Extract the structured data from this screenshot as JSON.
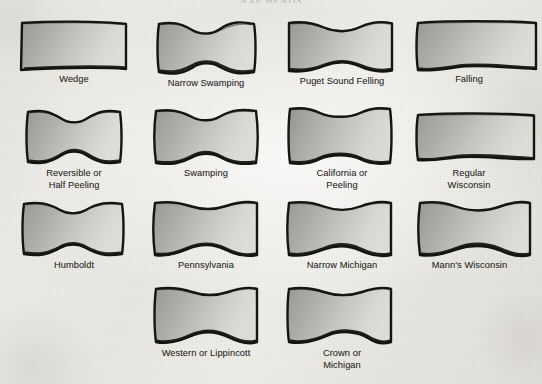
{
  "figure": {
    "kind": "axe-head-profile-chart",
    "running_head": "AXE HEADS",
    "background_color": "#e9e8e3",
    "ink_color": "#17150f",
    "blade_fill_light": "#d6d4d0",
    "blade_fill_dark": "#8f8d88",
    "caption_color": "#2c2a27",
    "columns": 4,
    "rows": 4,
    "item_count": 14
  },
  "items": [
    {
      "id": "wedge",
      "label": "Wedge",
      "row": 1,
      "column": 1,
      "shape": "wedge-straight-sided",
      "x": 18,
      "y": 20,
      "w": 112,
      "h": 52,
      "caption_x": 4,
      "caption_y": 74,
      "caption_w": 140
    },
    {
      "id": "narrow-swamping",
      "label": "Narrow Swamping",
      "row": 1,
      "column": 2,
      "shape": "narrow-swamping-waisted",
      "x": 150,
      "y": 20,
      "w": 112,
      "h": 56,
      "caption_x": 136,
      "caption_y": 78,
      "caption_w": 140
    },
    {
      "id": "puget-sound-felling",
      "label": "Puget Sound Felling",
      "row": 1,
      "column": 3,
      "shape": "puget-sound-felling-flared",
      "x": 284,
      "y": 20,
      "w": 112,
      "h": 54,
      "caption_x": 272,
      "caption_y": 76,
      "caption_w": 140
    },
    {
      "id": "falling",
      "label": "Falling",
      "row": 1,
      "column": 4,
      "shape": "falling-long-taper-cropped",
      "x": 410,
      "y": 20,
      "w": 128,
      "h": 52,
      "caption_x": 404,
      "caption_y": 74,
      "caption_w": 130
    },
    {
      "id": "reversible-or-half-peeling",
      "label": "Reversible or\nHalf Peeling",
      "row": 2,
      "column": 1,
      "shape": "reversible-deep-waist",
      "x": 18,
      "y": 108,
      "w": 112,
      "h": 58,
      "caption_x": 4,
      "caption_y": 168,
      "caption_w": 140
    },
    {
      "id": "swamping",
      "label": "Swamping",
      "row": 2,
      "column": 2,
      "shape": "swamping-waisted",
      "x": 150,
      "y": 108,
      "w": 112,
      "h": 58,
      "caption_x": 136,
      "caption_y": 168,
      "caption_w": 140
    },
    {
      "id": "california-or-peeling",
      "label": "California or\nPeeling",
      "row": 2,
      "column": 3,
      "shape": "california-peeling-bowtie",
      "x": 284,
      "y": 106,
      "w": 112,
      "h": 60,
      "caption_x": 272,
      "caption_y": 168,
      "caption_w": 140
    },
    {
      "id": "regular-wisconsin",
      "label": "Regular\nWisconsin",
      "row": 2,
      "column": 4,
      "shape": "regular-wisconsin-straight",
      "x": 410,
      "y": 112,
      "w": 126,
      "h": 50,
      "caption_x": 404,
      "caption_y": 168,
      "caption_w": 130
    },
    {
      "id": "humboldt",
      "label": "Humboldt",
      "row": 3,
      "column": 1,
      "shape": "humboldt-waisted",
      "x": 16,
      "y": 200,
      "w": 114,
      "h": 58,
      "caption_x": 4,
      "caption_y": 260,
      "caption_w": 140
    },
    {
      "id": "pennsylvania",
      "label": "Pennsylvania",
      "row": 3,
      "column": 2,
      "shape": "pennsylvania-flared",
      "x": 150,
      "y": 200,
      "w": 112,
      "h": 58,
      "caption_x": 136,
      "caption_y": 260,
      "caption_w": 140
    },
    {
      "id": "narrow-michigan",
      "label": "Narrow Michigan",
      "row": 3,
      "column": 3,
      "shape": "narrow-michigan-flared",
      "x": 284,
      "y": 200,
      "w": 112,
      "h": 58,
      "caption_x": 272,
      "caption_y": 260,
      "caption_w": 140
    },
    {
      "id": "manns-wisconsin",
      "label": "Mann's Wisconsin",
      "row": 3,
      "column": 4,
      "shape": "manns-wisconsin-flared",
      "x": 414,
      "y": 200,
      "w": 118,
      "h": 58,
      "caption_x": 402,
      "caption_y": 260,
      "caption_w": 135
    },
    {
      "id": "western-or-lippincott",
      "label": "Western or Lippincott",
      "row": 4,
      "column": 2,
      "shape": "western-lippincott-flared",
      "x": 150,
      "y": 286,
      "w": 112,
      "h": 60,
      "caption_x": 136,
      "caption_y": 348,
      "caption_w": 140
    },
    {
      "id": "crown-or-michigan",
      "label": "Crown or\nMichigan",
      "row": 4,
      "column": 3,
      "shape": "crown-michigan-flared",
      "x": 284,
      "y": 286,
      "w": 112,
      "h": 60,
      "caption_x": 272,
      "caption_y": 348,
      "caption_w": 140
    }
  ]
}
